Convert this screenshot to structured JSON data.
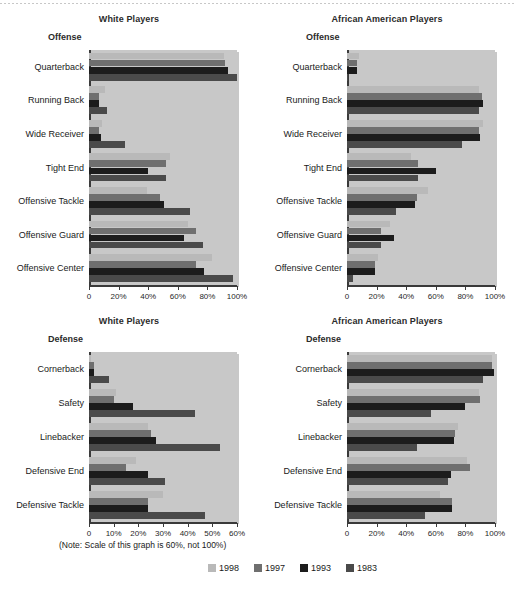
{
  "figure": {
    "note": "(Note: Scale of this graph is 60%, not 100%)",
    "legend_title": "",
    "series_colors": {
      "1998": "#b9b9b9",
      "1997": "#6f6f6f",
      "1993": "#1c1c1c",
      "1983": "#4a4a4a"
    }
  },
  "legend": {
    "items": [
      {
        "label": "1998",
        "color": "#b9b9b9"
      },
      {
        "label": "1997",
        "color": "#6f6f6f"
      },
      {
        "label": "1993",
        "color": "#1c1c1c"
      },
      {
        "label": "1983",
        "color": "#4a4a4a"
      }
    ]
  },
  "panels": [
    {
      "id": "offense-white",
      "title": "White Players",
      "group_label": "Offense",
      "xmax": 100,
      "xticks": [
        "0",
        "20%",
        "40%",
        "60%",
        "80%",
        "100%"
      ]
    },
    {
      "id": "offense-african-american",
      "title": "African American Players",
      "group_label": "Offense",
      "xmax": 100,
      "xticks": [
        "0",
        "20%",
        "40%",
        "60%",
        "80%",
        "100%"
      ]
    },
    {
      "id": "defense-white",
      "title": "White Players",
      "group_label": "Defense",
      "xmax": 60,
      "xticks": [
        "0",
        "10%",
        "20%",
        "30%",
        "40%",
        "50%",
        "60%"
      ]
    },
    {
      "id": "defense-african-american",
      "title": "African American Players",
      "group_label": "Defense",
      "xmax": 100,
      "xticks": [
        "0",
        "20%",
        "40%",
        "60%",
        "80%",
        "100%"
      ]
    }
  ],
  "chart_data": [
    {
      "type": "bar",
      "orientation": "horizontal",
      "id": "offense-white",
      "title": "White Players",
      "subtitle": "Offense",
      "xlabel": "",
      "ylabel": "",
      "xlim": [
        0,
        100
      ],
      "xticks": [
        0,
        20,
        40,
        60,
        80,
        100
      ],
      "xticklabels": [
        "0",
        "20%",
        "40%",
        "60%",
        "80%",
        "100%"
      ],
      "grid": false,
      "legend_position": "bottom-figure",
      "categories": [
        "Quarterback",
        "Running Back",
        "Wide Receiver",
        "Tight End",
        "Offensive Tackle",
        "Offensive Guard",
        "Offensive Center"
      ],
      "series": [
        {
          "name": "1998",
          "values": [
            91,
            11,
            9,
            55,
            39,
            67,
            83
          ]
        },
        {
          "name": "1997",
          "values": [
            92,
            7,
            7,
            52,
            48,
            72,
            72
          ]
        },
        {
          "name": "1993",
          "values": [
            94,
            7,
            8,
            40,
            51,
            64,
            78
          ]
        },
        {
          "name": "1983",
          "values": [
            100,
            12,
            24,
            52,
            68,
            77,
            97
          ]
        }
      ]
    },
    {
      "type": "bar",
      "orientation": "horizontal",
      "id": "offense-african-american",
      "title": "African American Players",
      "subtitle": "Offense",
      "xlabel": "",
      "ylabel": "",
      "xlim": [
        0,
        100
      ],
      "xticks": [
        0,
        20,
        40,
        60,
        80,
        100
      ],
      "xticklabels": [
        "0",
        "20%",
        "40%",
        "60%",
        "80%",
        "100%"
      ],
      "grid": false,
      "legend_position": "bottom-figure",
      "categories": [
        "Quarterback",
        "Running Back",
        "Wide Receiver",
        "Tight End",
        "Offensive Tackle",
        "Offensive Guard",
        "Offensive Center"
      ],
      "series": [
        {
          "name": "1998",
          "values": [
            8,
            89,
            92,
            43,
            55,
            29,
            21
          ]
        },
        {
          "name": "1997",
          "values": [
            7,
            91,
            89,
            48,
            47,
            23,
            19
          ]
        },
        {
          "name": "1993",
          "values": [
            7,
            92,
            90,
            60,
            46,
            32,
            19
          ]
        },
        {
          "name": "1983",
          "values": [
            1,
            89,
            78,
            48,
            33,
            23,
            4
          ]
        }
      ]
    },
    {
      "type": "bar",
      "orientation": "horizontal",
      "id": "defense-white",
      "title": "White Players",
      "subtitle": "Defense",
      "xlabel": "",
      "ylabel": "",
      "xlim": [
        0,
        60
      ],
      "xticks": [
        0,
        10,
        20,
        30,
        40,
        50,
        60
      ],
      "xticklabels": [
        "0",
        "10%",
        "20%",
        "30%",
        "40%",
        "50%",
        "60%"
      ],
      "grid": false,
      "legend_position": "bottom-figure",
      "note": "(Note: Scale of this graph is 60%, not 100%)",
      "categories": [
        "Cornerback",
        "Safety",
        "Linebacker",
        "Defensive End",
        "Defensive Tackle"
      ],
      "series": [
        {
          "name": "1998",
          "values": [
            1,
            11,
            24,
            19,
            30
          ]
        },
        {
          "name": "1997",
          "values": [
            2,
            10,
            25,
            15,
            24
          ]
        },
        {
          "name": "1993",
          "values": [
            2,
            18,
            27,
            24,
            24
          ]
        },
        {
          "name": "1983",
          "values": [
            8,
            43,
            53,
            31,
            47
          ]
        }
      ]
    },
    {
      "type": "bar",
      "orientation": "horizontal",
      "id": "defense-african-american",
      "title": "African American Players",
      "subtitle": "Defense",
      "xlabel": "",
      "ylabel": "",
      "xlim": [
        0,
        100
      ],
      "xticks": [
        0,
        20,
        40,
        60,
        80,
        100
      ],
      "xticklabels": [
        "0",
        "20%",
        "40%",
        "60%",
        "80%",
        "100%"
      ],
      "grid": false,
      "legend_position": "bottom-figure",
      "categories": [
        "Cornerback",
        "Safety",
        "Linebacker",
        "Defensive End",
        "Defensive Tackle"
      ],
      "series": [
        {
          "name": "1998",
          "values": [
            98,
            89,
            75,
            81,
            63
          ]
        },
        {
          "name": "1997",
          "values": [
            98,
            90,
            73,
            83,
            71
          ]
        },
        {
          "name": "1993",
          "values": [
            99,
            80,
            72,
            70,
            71
          ]
        },
        {
          "name": "1983",
          "values": [
            92,
            57,
            47,
            68,
            53
          ]
        }
      ]
    }
  ]
}
